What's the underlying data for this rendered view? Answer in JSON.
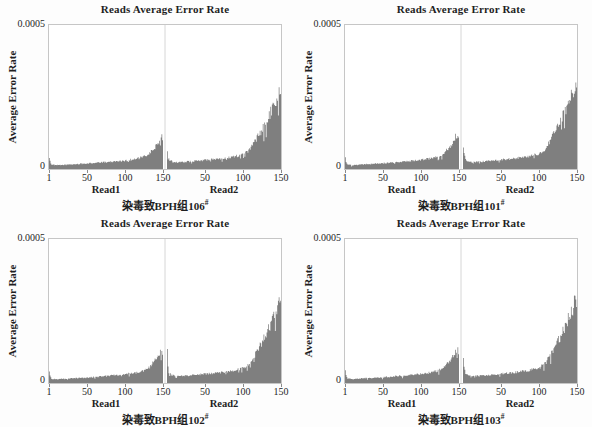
{
  "common": {
    "title": "Reads Average Error Rate",
    "ylabel": "Average Error Rate",
    "y_top": "0.0005",
    "y_bottom": "0",
    "read1_label": "Read1",
    "read2_label": "Read2",
    "x_ticks_read1": [
      "1",
      "50",
      "100",
      "150"
    ],
    "x_ticks_read2": [
      "50",
      "100",
      "150"
    ],
    "bar_color": "#7f7f7f",
    "axis_border_color": "#c6c6c6",
    "divider_color": "#d6d6d6"
  },
  "panels": [
    {
      "caption_base": "染毒致BPH组106",
      "caption_sup": "#"
    },
    {
      "caption_base": "染毒致BPH组101",
      "caption_sup": "#"
    },
    {
      "caption_base": "染毒致BPH组102",
      "caption_sup": "#"
    },
    {
      "caption_base": "染毒致BPH组103",
      "caption_sup": "#"
    }
  ],
  "chart_data": [
    {
      "type": "bar",
      "title": "Reads Average Error Rate",
      "xlabel": "Read1 / Read2 base position (1-150)",
      "ylabel": "Average Error Rate",
      "ylim": [
        0,
        0.0005
      ],
      "x_range_per_read": [
        1,
        150
      ],
      "panel_caption": "染毒致BPH组106#",
      "read1_envelope": [
        [
          1,
          4.2e-05
        ],
        [
          2,
          2.6e-05
        ],
        [
          4,
          1.6e-05
        ],
        [
          10,
          1.3e-05
        ],
        [
          25,
          1.5e-05
        ],
        [
          50,
          1.9e-05
        ],
        [
          75,
          2.4e-05
        ],
        [
          100,
          2.9e-05
        ],
        [
          115,
          3.5e-05
        ],
        [
          125,
          4.2e-05
        ],
        [
          132,
          5.2e-05
        ],
        [
          138,
          6.8e-05
        ],
        [
          143,
          8.6e-05
        ],
        [
          147,
          0.000104
        ],
        [
          149,
          0.00011
        ],
        [
          150,
          9.8e-05
        ]
      ],
      "read2_envelope": [
        [
          1,
          5.6e-05
        ],
        [
          2,
          4.4e-05
        ],
        [
          4,
          3.1e-05
        ],
        [
          8,
          2.5e-05
        ],
        [
          15,
          2.3e-05
        ],
        [
          30,
          2.6e-05
        ],
        [
          50,
          3.1e-05
        ],
        [
          70,
          3.6e-05
        ],
        [
          85,
          4.1e-05
        ],
        [
          95,
          4.7e-05
        ],
        [
          101,
          5.2e-05
        ],
        [
          106,
          6e-05
        ],
        [
          111,
          7.4e-05
        ],
        [
          116,
          9.4e-05
        ],
        [
          122,
          0.000121
        ],
        [
          129,
          0.000155
        ],
        [
          136,
          0.000195
        ],
        [
          143,
          0.000235
        ],
        [
          150,
          0.000275
        ]
      ]
    },
    {
      "type": "bar",
      "title": "Reads Average Error Rate",
      "xlabel": "Read1 / Read2 base position (1-150)",
      "ylabel": "Average Error Rate",
      "ylim": [
        0,
        0.0005
      ],
      "x_range_per_read": [
        1,
        150
      ],
      "panel_caption": "染毒致BPH组101#",
      "read1_envelope": [
        [
          1,
          4.5e-05
        ],
        [
          2,
          2.7e-05
        ],
        [
          4,
          1.6e-05
        ],
        [
          10,
          1.3e-05
        ],
        [
          25,
          1.6e-05
        ],
        [
          50,
          2e-05
        ],
        [
          75,
          2.5e-05
        ],
        [
          100,
          3.1e-05
        ],
        [
          115,
          3.8e-05
        ],
        [
          125,
          4.6e-05
        ],
        [
          132,
          5.8e-05
        ],
        [
          138,
          7.6e-05
        ],
        [
          143,
          9.6e-05
        ],
        [
          147,
          0.000116
        ],
        [
          149,
          0.000122
        ],
        [
          150,
          0.000106
        ]
      ],
      "read2_envelope": [
        [
          1,
          8.2e-05
        ],
        [
          2,
          5.6e-05
        ],
        [
          4,
          3.3e-05
        ],
        [
          8,
          2.6e-05
        ],
        [
          15,
          2.4e-05
        ],
        [
          30,
          2.7e-05
        ],
        [
          50,
          3.2e-05
        ],
        [
          70,
          3.7e-05
        ],
        [
          85,
          4.3e-05
        ],
        [
          95,
          4.9e-05
        ],
        [
          101,
          5.4e-05
        ],
        [
          106,
          6.3e-05
        ],
        [
          111,
          7.8e-05
        ],
        [
          116,
          0.0001
        ],
        [
          122,
          0.00013
        ],
        [
          129,
          0.000167
        ],
        [
          136,
          0.00021
        ],
        [
          143,
          0.000255
        ],
        [
          150,
          0.0003
        ]
      ]
    },
    {
      "type": "bar",
      "title": "Reads Average Error Rate",
      "xlabel": "Read1 / Read2 base position (1-150)",
      "ylabel": "Average Error Rate",
      "ylim": [
        0,
        0.0005
      ],
      "x_range_per_read": [
        1,
        150
      ],
      "panel_caption": "染毒致BPH组102#",
      "read1_envelope": [
        [
          1,
          4.3e-05
        ],
        [
          2,
          2.6e-05
        ],
        [
          4,
          1.5e-05
        ],
        [
          10,
          1.3e-05
        ],
        [
          25,
          1.5e-05
        ],
        [
          50,
          1.9e-05
        ],
        [
          75,
          2.4e-05
        ],
        [
          100,
          3e-05
        ],
        [
          115,
          3.6e-05
        ],
        [
          125,
          4.3e-05
        ],
        [
          132,
          5.4e-05
        ],
        [
          138,
          7e-05
        ],
        [
          143,
          8.8e-05
        ],
        [
          147,
          0.000105
        ],
        [
          149,
          0.00011
        ],
        [
          150,
          9.6e-05
        ]
      ],
      "read2_envelope": [
        [
          1,
          0.000112
        ],
        [
          2,
          6.2e-05
        ],
        [
          3,
          3.8e-05
        ],
        [
          6,
          2.7e-05
        ],
        [
          15,
          2.4e-05
        ],
        [
          30,
          2.6e-05
        ],
        [
          50,
          3.1e-05
        ],
        [
          70,
          3.6e-05
        ],
        [
          85,
          4.2e-05
        ],
        [
          95,
          4.8e-05
        ],
        [
          101,
          5.3e-05
        ],
        [
          106,
          6.1e-05
        ],
        [
          111,
          7.5e-05
        ],
        [
          116,
          9.6e-05
        ],
        [
          122,
          0.000123
        ],
        [
          129,
          0.000158
        ],
        [
          136,
          0.0002
        ],
        [
          143,
          0.00024
        ],
        [
          150,
          0.00028
        ]
      ]
    },
    {
      "type": "bar",
      "title": "Reads Average Error Rate",
      "xlabel": "Read1 / Read2 base position (1-150)",
      "ylabel": "Average Error Rate",
      "ylim": [
        0,
        0.0005
      ],
      "x_range_per_read": [
        1,
        150
      ],
      "panel_caption": "染毒致BPH组103#",
      "read1_envelope": [
        [
          1,
          4.4e-05
        ],
        [
          2,
          2.7e-05
        ],
        [
          4,
          1.6e-05
        ],
        [
          10,
          1.3e-05
        ],
        [
          25,
          1.6e-05
        ],
        [
          50,
          2e-05
        ],
        [
          75,
          2.5e-05
        ],
        [
          100,
          3.1e-05
        ],
        [
          115,
          3.7e-05
        ],
        [
          125,
          4.5e-05
        ],
        [
          132,
          5.6e-05
        ],
        [
          138,
          7.4e-05
        ],
        [
          143,
          9.4e-05
        ],
        [
          147,
          0.000112
        ],
        [
          149,
          0.000118
        ],
        [
          150,
          0.000102
        ]
      ],
      "read2_envelope": [
        [
          1,
          8e-05
        ],
        [
          2,
          5.4e-05
        ],
        [
          4,
          3.2e-05
        ],
        [
          8,
          2.6e-05
        ],
        [
          15,
          2.4e-05
        ],
        [
          30,
          2.7e-05
        ],
        [
          50,
          3.2e-05
        ],
        [
          70,
          3.7e-05
        ],
        [
          85,
          4.3e-05
        ],
        [
          95,
          4.9e-05
        ],
        [
          101,
          5.4e-05
        ],
        [
          106,
          6.2e-05
        ],
        [
          111,
          7.7e-05
        ],
        [
          116,
          9.8e-05
        ],
        [
          122,
          0.000127
        ],
        [
          129,
          0.000163
        ],
        [
          136,
          0.000205
        ],
        [
          143,
          0.00025
        ],
        [
          150,
          0.000295
        ]
      ]
    }
  ]
}
